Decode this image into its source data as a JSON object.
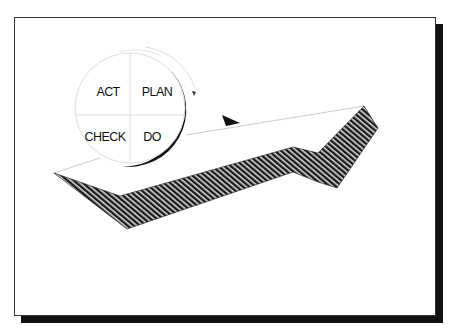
{
  "diagram": {
    "cycle_labels": {
      "act": "ACT",
      "plan": "PLAN",
      "check": "CHECK",
      "do": "DO"
    },
    "colors": {
      "frame": "#333333",
      "shadow": "#111111",
      "hatch_dark": "#1a1a1a",
      "hatch_light": "#d8d8d8",
      "guide_line": "#cccccc"
    }
  }
}
